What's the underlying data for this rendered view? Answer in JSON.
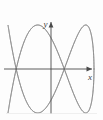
{
  "figure": {
    "label": "VI",
    "background_color": "#fdfdfd",
    "curve_color": "#8a8a8a",
    "axis_color": "#4a4a4a",
    "border_color": "#e2e2e2"
  },
  "axes": {
    "x_label": "x",
    "y_label": "y",
    "x_arrow": "arrow-right",
    "y_arrow": "arrow-up",
    "origin": {
      "x": 51,
      "y": 69
    }
  },
  "chart_data": {
    "type": "line",
    "title": "VI",
    "subtitle": "",
    "xlabel": "x",
    "ylabel": "y",
    "grid": false,
    "legend": false,
    "legend_position": "none",
    "xlim": [
      -1.15,
      1.15
    ],
    "ylim": [
      -1.15,
      1.15
    ],
    "parametric": {
      "x_expr": "A*sin(a*t + delta)",
      "y_expr": "B*sin(b*t)",
      "A": 1.0,
      "B": 1.0,
      "a": 2,
      "b": 5,
      "delta": 1.5707963,
      "t_range": [
        0,
        6.2831853
      ],
      "samples": 900
    },
    "series": [
      {
        "name": "lissajous-2-5",
        "color": "#8a8a8a",
        "x": [
          0.0,
          0.0,
          0.0,
          0.0
        ],
        "values": [
          0.0,
          0.0,
          0.0,
          0.0
        ]
      }
    ],
    "features": {
      "horizontal_lobes": 2,
      "vertical_lobes": 5,
      "axis_crossings_on_y_axis": 5,
      "closed_curve": true
    }
  }
}
